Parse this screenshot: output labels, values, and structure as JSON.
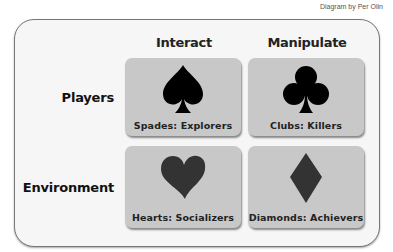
{
  "credit": "Diagram by Per Olin",
  "columns": [
    {
      "label": "Interact"
    },
    {
      "label": "Manipulate"
    }
  ],
  "rows": [
    {
      "label": "Players"
    },
    {
      "label": "Environment"
    }
  ],
  "cells": [
    {
      "suit": "spade-icon",
      "label": "Spades: Explorers",
      "color": "#000000"
    },
    {
      "suit": "club-icon",
      "label": "Clubs: Killers",
      "color": "#000000"
    },
    {
      "suit": "heart-icon",
      "label": "Hearts: Socializers",
      "color": "#333333"
    },
    {
      "suit": "diamond-icon",
      "label": "Diamonds: Achievers",
      "color": "#333333"
    }
  ],
  "colors": {
    "card_bg": "#c8c8c8",
    "frame_bg": "#f6f6f6"
  }
}
